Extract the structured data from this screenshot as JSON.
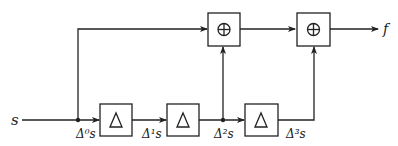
{
  "diagram": {
    "input_label": "s",
    "output_label": "f",
    "delta_symbol": "△",
    "adder_symbol": "⊕",
    "signals": {
      "d0": "Δ⁰s",
      "d1": "Δ¹s",
      "d2": "Δ²s",
      "d3": "Δ³s"
    },
    "blocks": [
      {
        "id": "delta-1",
        "type": "difference",
        "symbol": "△"
      },
      {
        "id": "delta-2",
        "type": "difference",
        "symbol": "△"
      },
      {
        "id": "delta-3",
        "type": "difference",
        "symbol": "△"
      },
      {
        "id": "adder-1",
        "type": "sum",
        "symbol": "⊕"
      },
      {
        "id": "adder-2",
        "type": "sum",
        "symbol": "⊕"
      }
    ]
  }
}
